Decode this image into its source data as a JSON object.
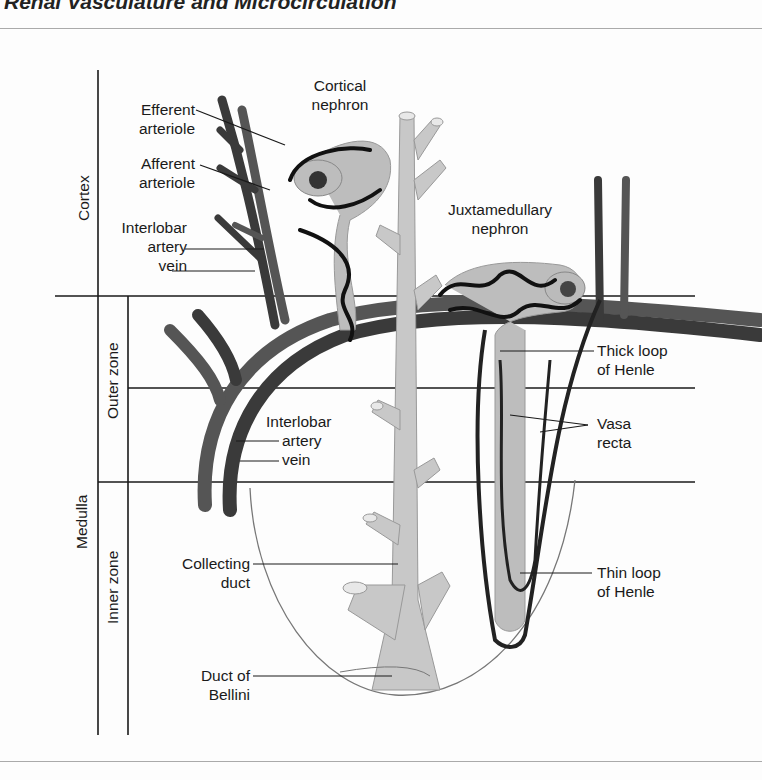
{
  "header": {
    "title": "Renal Vasculature and Microcirculation"
  },
  "regions": {
    "cortex": "Cortex",
    "medulla": "Medulla",
    "outer_zone": "Outer zone",
    "inner_zone": "Inner zone"
  },
  "labels": {
    "efferent_arteriole": [
      "Efferent",
      "arteriole"
    ],
    "afferent_arteriole": [
      "Afferent",
      "arteriole"
    ],
    "interlobar_cortex": [
      "Interlobar",
      "artery",
      "vein"
    ],
    "cortical_nephron": [
      "Cortical",
      "nephron"
    ],
    "juxtamedullary_nephron": [
      "Juxtamedullary",
      "nephron"
    ],
    "thick_loop": [
      "Thick loop",
      "of Henle"
    ],
    "vasa_recta": [
      "Vasa",
      "recta"
    ],
    "interlobar_medulla": [
      "Interlobar",
      "artery",
      "vein"
    ],
    "collecting_duct": [
      "Collecting",
      "duct"
    ],
    "thin_loop": [
      "Thin loop",
      "of Henle"
    ],
    "duct_of_bellini": [
      "Duct of",
      "Bellini"
    ]
  },
  "colors": {
    "vessel_dark": "#3a3a3a",
    "vessel_mid": "#555555",
    "duct_fill": "#c8c8c8",
    "nephron_fill": "#bdbdbd",
    "capillary": "#111111",
    "line": "#1a1a1a"
  }
}
